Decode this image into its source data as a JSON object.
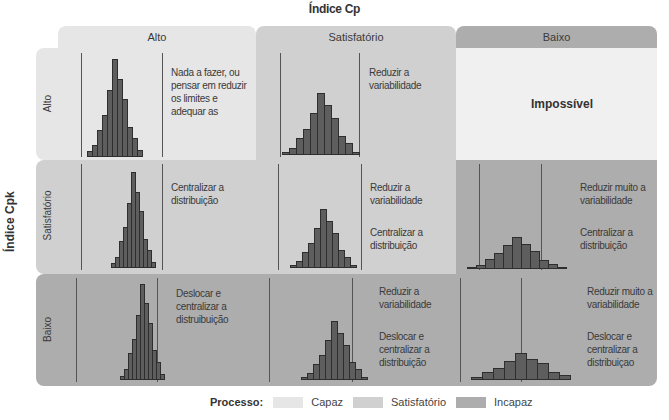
{
  "titles": {
    "x_axis": "Índice Cp",
    "y_axis": "Índice Cpk"
  },
  "columns": [
    {
      "label": "Alto"
    },
    {
      "label": "Satisfatório"
    },
    {
      "label": "Baixo"
    }
  ],
  "rows": [
    {
      "label": "Alto"
    },
    {
      "label": "Satisfatório"
    },
    {
      "label": "Baixo"
    }
  ],
  "cells": {
    "r0c0": {
      "text": "Nada a fazer, ou pensar em reduzir os limites e adequar as",
      "category": "Capaz"
    },
    "r0c1": {
      "text": "Reduzir a variabilidade",
      "category": "Satisfatório"
    },
    "r0c2": {
      "text": "Impossível",
      "category": "Impossível"
    },
    "r1c0": {
      "text": "Centralizar a distribuição",
      "category": "Satisfatório"
    },
    "r1c1": {
      "text1": "Reduzir a variabilidade",
      "text2": "Centralizar a distribuição",
      "category": "Satisfatório"
    },
    "r1c2": {
      "text1": "Reduzir muito a variabilidade",
      "text2": "Centralizar a distribuição",
      "category": "Incapaz"
    },
    "r2c0": {
      "text": "Deslocar e centralizar a distruibuição",
      "category": "Incapaz"
    },
    "r2c1": {
      "text1": "Reduzir a variabilidade",
      "text2": "Deslocar e centralizar a distribuição",
      "category": "Incapaz"
    },
    "r2c2": {
      "text1": "Reduzir muito a variabilidade",
      "text2": "Deslocar e centralizar a distribuiçao",
      "category": "Incapaz"
    }
  },
  "legend": {
    "title": "Processo:",
    "items": [
      {
        "label": "Capaz",
        "color": "#e6e6e6"
      },
      {
        "label": "Satisfatório",
        "color": "#d0d0d0"
      },
      {
        "label": "Incapaz",
        "color": "#adadad"
      }
    ]
  },
  "colors": {
    "capaz": "#e6e6e6",
    "satisfatorio": "#d0d0d0",
    "incapaz": "#adadad",
    "impossivel": "#f0f0f0",
    "bar": "#5e5e5e"
  }
}
